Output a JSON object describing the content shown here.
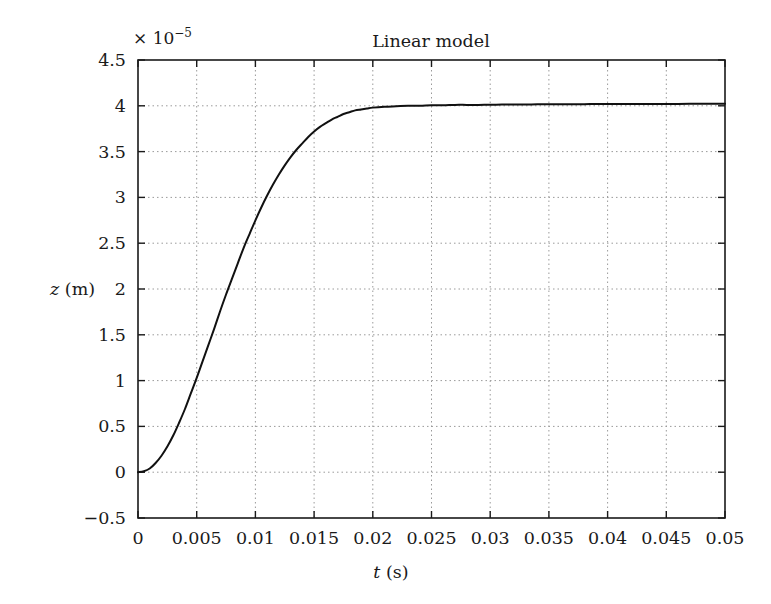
{
  "figure": {
    "background_color": "#ffffff",
    "axes_color": "#1a1a1a",
    "grid_color": "#9a9a9a",
    "curve_color": "#111111"
  },
  "chart_data": {
    "type": "line",
    "title": "Linear model",
    "xlabel": "t (s)",
    "ylabel": "z (m)",
    "xlabel_var": "t",
    "xlabel_unit": "(s)",
    "ylabel_var": "z",
    "ylabel_unit": "(m)",
    "y_exponent_prefix": "× 10",
    "y_exponent_value": "−5",
    "y_scale_factor": 1e-05,
    "xlim": [
      0,
      0.05
    ],
    "ylim": [
      -0.5,
      4.5
    ],
    "grid": true,
    "grid_style": "dotted",
    "legend": "none",
    "xticks": [
      0,
      0.005,
      0.01,
      0.015,
      0.02,
      0.025,
      0.03,
      0.035,
      0.04,
      0.045,
      0.05
    ],
    "xtick_labels": [
      "0",
      "0.005",
      "0.01",
      "0.015",
      "0.02",
      "0.025",
      "0.03",
      "0.035",
      "0.04",
      "0.045",
      "0.05"
    ],
    "yticks": [
      -0.5,
      0,
      0.5,
      1,
      1.5,
      2,
      2.5,
      3,
      3.5,
      4,
      4.5
    ],
    "ytick_labels": [
      "−0.5",
      "0",
      "0.5",
      "1",
      "1.5",
      "2",
      "2.5",
      "3",
      "3.5",
      "4",
      "4.5"
    ],
    "series": [
      {
        "name": "Linear model step response",
        "color": "#111111",
        "line_width": 2,
        "steady_state_value": 4.02,
        "x": [
          0,
          0.0005,
          0.001,
          0.0015,
          0.002,
          0.0025,
          0.003,
          0.0035,
          0.004,
          0.0045,
          0.005,
          0.0055,
          0.006,
          0.0065,
          0.007,
          0.0075,
          0.008,
          0.0085,
          0.009,
          0.0095,
          0.01,
          0.0105,
          0.011,
          0.0115,
          0.012,
          0.0125,
          0.013,
          0.0135,
          0.014,
          0.0145,
          0.015,
          0.0155,
          0.016,
          0.0165,
          0.017,
          0.0175,
          0.018,
          0.0185,
          0.019,
          0.0195,
          0.02,
          0.021,
          0.022,
          0.023,
          0.024,
          0.025,
          0.026,
          0.027,
          0.028,
          0.029,
          0.03,
          0.031,
          0.032,
          0.033,
          0.034,
          0.035,
          0.036,
          0.037,
          0.038,
          0.039,
          0.04,
          0.042,
          0.044,
          0.046,
          0.048,
          0.05
        ],
        "y": [
          0.0,
          0.01,
          0.04,
          0.1,
          0.18,
          0.28,
          0.4,
          0.54,
          0.69,
          0.86,
          1.03,
          1.21,
          1.39,
          1.57,
          1.76,
          1.94,
          2.11,
          2.28,
          2.45,
          2.6,
          2.75,
          2.89,
          3.02,
          3.14,
          3.25,
          3.35,
          3.44,
          3.52,
          3.59,
          3.66,
          3.72,
          3.77,
          3.81,
          3.85,
          3.88,
          3.91,
          3.93,
          3.95,
          3.96,
          3.97,
          3.98,
          3.99,
          3.995,
          4.0,
          4.0,
          4.005,
          4.005,
          4.01,
          4.01,
          4.01,
          4.012,
          4.013,
          4.014,
          4.015,
          4.016,
          4.017,
          4.017,
          4.018,
          4.018,
          4.019,
          4.019,
          4.02,
          4.021,
          4.021,
          4.022,
          4.022
        ]
      }
    ]
  }
}
